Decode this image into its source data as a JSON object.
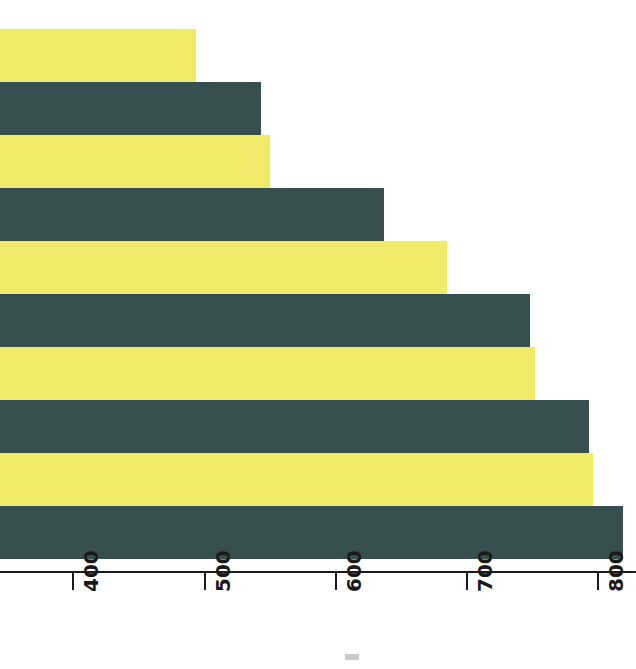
{
  "chart_data": {
    "type": "bar",
    "orientation": "horizontal",
    "title": "",
    "subtitle": "",
    "xlabel": "",
    "ylabel": "",
    "categories": [
      "1",
      "2",
      "3",
      "4",
      "5",
      "6",
      "7",
      "8",
      "9",
      "10"
    ],
    "values": [
      494,
      543,
      550,
      637,
      685,
      748,
      752,
      793,
      796,
      819
    ],
    "bar_colors": [
      "#F0EA6B",
      "#37504F",
      "#F0EA6B",
      "#37504F",
      "#F0EA6B",
      "#37504F",
      "#F0EA6B",
      "#37504F",
      "#F0EA6B",
      "#37504F"
    ],
    "xlim": [
      345,
      830
    ],
    "axis_ticks": [
      400,
      500,
      600,
      700,
      800
    ],
    "tick_labels": [
      "400",
      "500",
      "600",
      "700",
      "800"
    ],
    "grid": false,
    "legend": null,
    "legend_position": "none",
    "annotations": []
  },
  "axis": {
    "ticks": [
      {
        "label": "400",
        "value": 400,
        "x": 73
      },
      {
        "label": "500",
        "value": 500,
        "x": 205
      },
      {
        "label": "600",
        "value": 600,
        "x": 336
      },
      {
        "label": "700",
        "value": 700,
        "x": 467
      },
      {
        "label": "800",
        "value": 800,
        "x": 598
      }
    ],
    "line_color": "#1a1a1a",
    "label_color": "#1a1a1a",
    "label_rotation_degrees": -90
  },
  "palette": {
    "background": "#FFFFFF",
    "series_light": "#F0EA6B",
    "series_dark": "#37504F",
    "axis": "#1A1A1A"
  }
}
